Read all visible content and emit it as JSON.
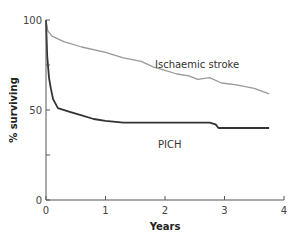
{
  "chart_data": {
    "type": "line",
    "title": "",
    "xlabel": "Years",
    "ylabel": "% surviving",
    "xlim": [
      0,
      4
    ],
    "ylim": [
      0,
      100
    ],
    "x_ticks": [
      "0",
      "1",
      "2",
      "3",
      "4"
    ],
    "y_ticks": [
      "0",
      "50",
      "100"
    ],
    "y_minor_ticks": [
      25,
      75
    ],
    "grid": false,
    "series": [
      {
        "name": "Ischaemic stroke",
        "color": "#999999",
        "points": [
          [
            0,
            100
          ],
          [
            0.03,
            94
          ],
          [
            0.1,
            91
          ],
          [
            0.3,
            88
          ],
          [
            0.6,
            85
          ],
          [
            1.0,
            82
          ],
          [
            1.3,
            79
          ],
          [
            1.6,
            77
          ],
          [
            1.8,
            74
          ],
          [
            2.0,
            72
          ],
          [
            2.2,
            70
          ],
          [
            2.4,
            69
          ],
          [
            2.55,
            67
          ],
          [
            2.75,
            68
          ],
          [
            2.95,
            65
          ],
          [
            3.2,
            64
          ],
          [
            3.5,
            62
          ],
          [
            3.75,
            59
          ]
        ]
      },
      {
        "name": "PICH",
        "color": "#333333",
        "points": [
          [
            0,
            100
          ],
          [
            0.02,
            80
          ],
          [
            0.05,
            68
          ],
          [
            0.08,
            62
          ],
          [
            0.12,
            56
          ],
          [
            0.2,
            51
          ],
          [
            0.4,
            49
          ],
          [
            0.6,
            47
          ],
          [
            0.8,
            45
          ],
          [
            1.0,
            44
          ],
          [
            1.3,
            43
          ],
          [
            1.6,
            43
          ],
          [
            2.0,
            43
          ],
          [
            2.4,
            43
          ],
          [
            2.75,
            43
          ],
          [
            2.85,
            42
          ],
          [
            2.9,
            40
          ],
          [
            3.2,
            40
          ],
          [
            3.75,
            40
          ]
        ]
      }
    ]
  }
}
